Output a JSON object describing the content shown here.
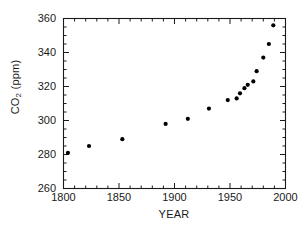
{
  "chart_data": {
    "type": "scatter",
    "title": "",
    "xlabel": "YEAR",
    "ylabel": "CO2 (ppm)",
    "ylabel_parts": {
      "base": "CO",
      "sub": "2",
      "unit": " (ppm)"
    },
    "xlim": [
      1800,
      2000
    ],
    "ylim": [
      260,
      360
    ],
    "xticks": [
      1800,
      1850,
      1900,
      1950,
      2000
    ],
    "xtick_labels": [
      "1800",
      "1850",
      "1900",
      "1950",
      "2000"
    ],
    "x_minor_step": 10,
    "yticks": [
      260,
      280,
      300,
      320,
      340,
      360
    ],
    "ytick_labels": [
      "260",
      "280",
      "300",
      "320",
      "340",
      "360"
    ],
    "y_minor_step": 5,
    "grid": false,
    "legend": null,
    "marker": {
      "shape": "circle",
      "color": "#000000",
      "size": 4.2
    },
    "series": [
      {
        "name": "CO2 concentration",
        "x": [
          1804,
          1823,
          1853,
          1892,
          1912,
          1931,
          1948,
          1956,
          1959,
          1963,
          1966,
          1971,
          1974,
          1980,
          1985,
          1989
        ],
        "y": [
          281,
          285,
          289,
          298,
          301,
          307,
          312,
          313,
          316,
          319,
          321,
          323,
          329,
          337,
          345,
          356
        ]
      }
    ]
  },
  "figure": {
    "background": "#ffffff",
    "axis_color": "#1a1a1a",
    "text_color": "#1a1a1a"
  }
}
